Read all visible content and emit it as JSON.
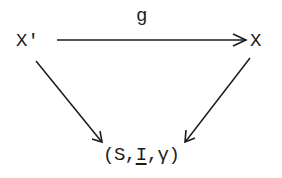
{
  "diagram": {
    "type": "commutative-triangle",
    "nodes": {
      "source": {
        "label": "X'"
      },
      "target_top": {
        "label": "X"
      },
      "bottom": {
        "open": "(",
        "s": "S",
        "sep1": ",",
        "i": "I",
        "sep2": ",",
        "gamma": "γ",
        "close": ")"
      }
    },
    "edges": [
      {
        "from": "X'",
        "to": "X",
        "label": "g"
      },
      {
        "from": "X'",
        "to": "(S,I,γ)",
        "label": ""
      },
      {
        "from": "X",
        "to": "(S,I,γ)",
        "label": ""
      }
    ],
    "morphism_label": "g",
    "colors": {
      "ink": "#1c1c1c",
      "background": "#ffffff"
    }
  }
}
